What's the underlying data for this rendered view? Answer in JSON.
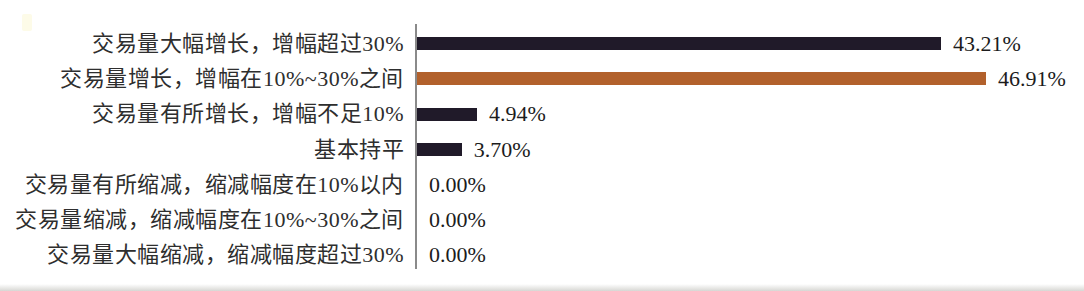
{
  "chart_data": {
    "type": "bar",
    "orientation": "horizontal",
    "title": "",
    "xlabel": "",
    "ylabel": "",
    "grid": false,
    "legend_position": "none",
    "xlim": [
      0,
      55
    ],
    "categories": [
      "交易量大幅增长，增幅超过30%",
      "交易量增长，增幅在10%~30%之间",
      "交易量有所增长，增幅不足10%",
      "基本持平",
      "交易量有所缩减，缩减幅度在10%以内",
      "交易量缩减，缩减幅度在10%~30%之间",
      "交易量大幅缩减，缩减幅度超过30%"
    ],
    "values": [
      43.21,
      46.91,
      4.94,
      3.7,
      0.0,
      0.0,
      0.0
    ],
    "value_labels": [
      "43.21%",
      "46.91%",
      "4.94%",
      "3.70%",
      "0.00%",
      "0.00%",
      "0.00%"
    ],
    "bar_colors": [
      "#201a29",
      "#b2612c",
      "#201a29",
      "#201a29",
      "#201a29",
      "#201a29",
      "#201a29"
    ],
    "colors": {
      "axis": "#8a8a8a",
      "category_label": "#2e2e2e",
      "value_label": "#1c1c1c",
      "bar_dark": "#201a29",
      "bar_brown": "#b2612c"
    }
  }
}
